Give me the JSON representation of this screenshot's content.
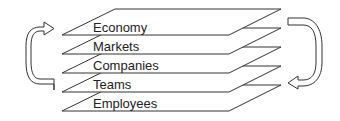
{
  "diagram": {
    "layers": [
      {
        "label": "Economy"
      },
      {
        "label": "Markets"
      },
      {
        "label": "Companies"
      },
      {
        "label": "Teams"
      },
      {
        "label": "Employees"
      }
    ],
    "arrows": [
      {
        "side": "left",
        "direction": "upward"
      },
      {
        "side": "right",
        "direction": "downward"
      }
    ],
    "colors": {
      "stroke": "#333333",
      "background": "#ffffff"
    }
  }
}
